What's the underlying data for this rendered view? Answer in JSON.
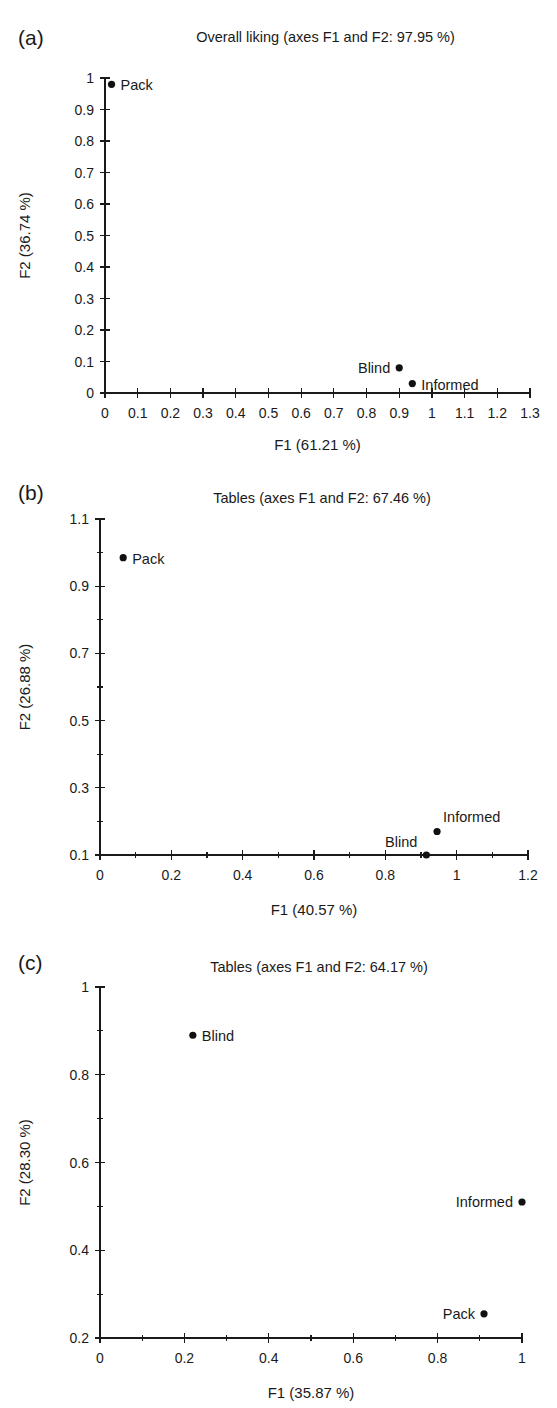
{
  "figure": {
    "background_color": "#ffffff",
    "point_color": "#111111",
    "axis_color": "#1a1a1a"
  },
  "panels": [
    {
      "letter": "(a)",
      "chart_data": {
        "type": "scatter",
        "title": "Overall liking (axes F1 and F2: 97.95 %)",
        "xlabel": "F1 (61.21 %)",
        "ylabel": "F2 (36.74 %)",
        "xlim": [
          0,
          1.3
        ],
        "ylim": [
          0,
          1
        ],
        "xticks": [
          "0",
          "0.1",
          "0.2",
          "0.3",
          "0.4",
          "0.5",
          "0.6",
          "0.7",
          "0.8",
          "0.9",
          "1",
          "1.1",
          "1.2",
          "1.3"
        ],
        "xtick_values": [
          0,
          0.1,
          0.2,
          0.3,
          0.4,
          0.5,
          0.6,
          0.7,
          0.8,
          0.9,
          1.0,
          1.1,
          1.2,
          1.3
        ],
        "yticks": [
          "0",
          "0.1",
          "0.2",
          "0.3",
          "0.4",
          "0.5",
          "0.6",
          "0.7",
          "0.8",
          "0.9",
          "1"
        ],
        "ytick_values": [
          0,
          0.1,
          0.2,
          0.3,
          0.4,
          0.5,
          0.6,
          0.7,
          0.8,
          0.9,
          1.0
        ],
        "grid": false,
        "legend": "none",
        "points": [
          {
            "label": "Pack",
            "x": 0.02,
            "y": 0.98,
            "label_pos": "right"
          },
          {
            "label": "Blind",
            "x": 0.9,
            "y": 0.08,
            "label_pos": "left"
          },
          {
            "label": "Informed",
            "x": 0.94,
            "y": 0.03,
            "label_pos": "right"
          }
        ]
      }
    },
    {
      "letter": "(b)",
      "chart_data": {
        "type": "scatter",
        "title": "Tables (axes F1 and F2: 67.46 %)",
        "xlabel": "F1 (40.57 %)",
        "ylabel": "F2 (26.88 %)",
        "xlim": [
          0,
          1.2
        ],
        "ylim": [
          0.1,
          1.1
        ],
        "xticks": [
          "0",
          "0.2",
          "0.4",
          "0.6",
          "0.8",
          "1",
          "1.2"
        ],
        "xtick_values": [
          0,
          0.2,
          0.4,
          0.6,
          0.8,
          1.0,
          1.2
        ],
        "yticks": [
          "0.1",
          "0.3",
          "0.5",
          "0.7",
          "0.9",
          "1.1"
        ],
        "ytick_values": [
          0.1,
          0.3,
          0.5,
          0.7,
          0.9,
          1.1
        ],
        "grid": false,
        "legend": "none",
        "points": [
          {
            "label": "Pack",
            "x": 0.065,
            "y": 0.985,
            "label_pos": "right"
          },
          {
            "label": "Informed",
            "x": 0.945,
            "y": 0.17,
            "label_pos": "upper-right"
          },
          {
            "label": "Blind",
            "x": 0.915,
            "y": 0.1,
            "label_pos": "upper-left"
          }
        ]
      }
    },
    {
      "letter": "(c)",
      "chart_data": {
        "type": "scatter",
        "title": "Tables (axes F1 and F2: 64.17 %)",
        "xlabel": "F1 (35.87 %)",
        "ylabel": "F2 (28.30 %)",
        "xlim": [
          0,
          1
        ],
        "ylim": [
          0.2,
          1
        ],
        "xticks": [
          "0",
          "0.2",
          "0.4",
          "0.6",
          "0.8",
          "1"
        ],
        "xtick_values": [
          0,
          0.2,
          0.4,
          0.6,
          0.8,
          1.0
        ],
        "yticks": [
          "0.2",
          "0.4",
          "0.6",
          "0.8",
          "1"
        ],
        "ytick_values": [
          0.2,
          0.4,
          0.6,
          0.8,
          1.0
        ],
        "grid": false,
        "legend": "none",
        "points": [
          {
            "label": "Blind",
            "x": 0.22,
            "y": 0.89,
            "label_pos": "right"
          },
          {
            "label": "Informed",
            "x": 1.0,
            "y": 0.51,
            "label_pos": "left"
          },
          {
            "label": "Pack",
            "x": 0.91,
            "y": 0.255,
            "label_pos": "left"
          }
        ]
      }
    }
  ]
}
